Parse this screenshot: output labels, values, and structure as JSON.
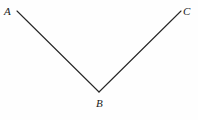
{
  "figure": {
    "name": "angle-abc-diagram",
    "background_color": "#fefefe",
    "stroke_color": "#262626",
    "stroke_width": 1.1,
    "width": 198,
    "height": 120,
    "labels": {
      "a": "A",
      "b": "B",
      "c": "C"
    },
    "points": {
      "a": {
        "x": 17,
        "y": 11
      },
      "b": {
        "x": 99,
        "y": 92
      },
      "c": {
        "x": 181,
        "y": 11
      }
    },
    "segments": [
      {
        "name": "segment-ab",
        "from": "a",
        "to": "b"
      },
      {
        "name": "segment-bc",
        "from": "b",
        "to": "c"
      }
    ]
  }
}
